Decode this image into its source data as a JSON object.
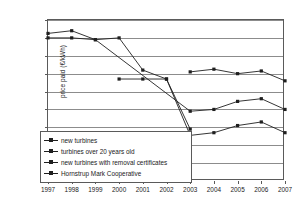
{
  "chart_data": {
    "type": "line",
    "title": "",
    "xlabel": "",
    "ylabel": "price paid (€/kWh)",
    "x": [
      1997,
      1998,
      1999,
      2000,
      2001,
      2002,
      2003,
      2004,
      2005,
      2006,
      2007
    ],
    "xtick_labels": [
      "1997",
      "1998",
      "1999",
      "2000",
      "2001",
      "2002",
      "2003",
      "2004",
      "2005",
      "2006",
      "2007"
    ],
    "ytick_labels": [
      "0.09",
      "0.08",
      "0.07",
      "0.06",
      "0.05",
      "0.04",
      "0.03",
      "0.02",
      "0.01",
      "0"
    ],
    "ytick_values": [
      0.09,
      0.08,
      0.07,
      0.06,
      0.05,
      0.04,
      0.03,
      0.02,
      0.01,
      0
    ],
    "ylim": [
      0,
      0.09
    ],
    "xlim": [
      1997,
      2007
    ],
    "grid": "horizontal",
    "legend_position": "inside-bottom-left",
    "series": [
      {
        "name": "new turbines",
        "x": [
          1997,
          1998,
          1999,
          2000,
          2001,
          2002,
          2003
        ],
        "values": [
          0.08,
          0.08,
          0.079,
          0.08,
          0.062,
          0.057,
          0.029
        ]
      },
      {
        "name": "turbines over 20 years old",
        "x": [
          2000,
          2001,
          2002,
          2003,
          2004,
          2005,
          2006,
          2007
        ],
        "values": [
          0.057,
          0.057,
          0.057,
          0.0255,
          0.027,
          0.031,
          0.033,
          0.027
        ]
      },
      {
        "name": "new turbines with removal certificates",
        "x": [
          1997,
          1998,
          1999,
          2003,
          2004,
          2005,
          2006,
          2007
        ],
        "values": [
          0.0825,
          0.084,
          0.079,
          0.039,
          0.04,
          0.0445,
          0.046,
          0.04
        ]
      },
      {
        "name": "Hornstrup Mark Cooperative",
        "x": [
          2003,
          2004,
          2005,
          2006,
          2007
        ],
        "values": [
          0.061,
          0.0625,
          0.06,
          0.0615,
          0.056
        ]
      }
    ],
    "colors": {
      "series_line": "#1f1f1f",
      "gridline": "#8c8c8c",
      "axis": "#5a5a5a",
      "background": "#ffffff"
    }
  }
}
